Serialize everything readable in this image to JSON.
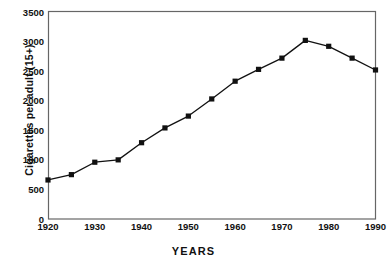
{
  "chart_data": {
    "type": "line",
    "title": "",
    "xlabel": "YEARS",
    "ylabel": "Cigarettes per adult (15+)",
    "xlim": [
      1920,
      1990
    ],
    "ylim": [
      0,
      3500
    ],
    "xticks": [
      1920,
      1930,
      1940,
      1950,
      1960,
      1970,
      1980,
      1990
    ],
    "xtick_labels": [
      "1920",
      "1930",
      "1940",
      "1950",
      "1960",
      "1970",
      "1980",
      "1990"
    ],
    "yticks": [
      0,
      500,
      1000,
      1500,
      2000,
      2500,
      3000,
      3500
    ],
    "ytick_labels": [
      "0",
      "500",
      "1000",
      "1500",
      "2000",
      "2500",
      "3000",
      "3500"
    ],
    "grid": false,
    "legend": null,
    "marker": "square",
    "marker_color": "#111111",
    "line_color": "#111111",
    "x": [
      1920,
      1925,
      1930,
      1935,
      1940,
      1945,
      1950,
      1955,
      1960,
      1965,
      1970,
      1975,
      1980,
      1985,
      1990
    ],
    "y": [
      660,
      750,
      960,
      1000,
      1290,
      1540,
      1740,
      2030,
      2330,
      2530,
      2720,
      3020,
      2920,
      2720,
      2520
    ],
    "series": [
      {
        "name": "Cigarettes per adult (15+)",
        "points": [
          {
            "x": 1920,
            "y": 660
          },
          {
            "x": 1925,
            "y": 750
          },
          {
            "x": 1930,
            "y": 960
          },
          {
            "x": 1935,
            "y": 1000
          },
          {
            "x": 1940,
            "y": 1290
          },
          {
            "x": 1945,
            "y": 1540
          },
          {
            "x": 1950,
            "y": 1740
          },
          {
            "x": 1955,
            "y": 2030
          },
          {
            "x": 1960,
            "y": 2330
          },
          {
            "x": 1965,
            "y": 2530
          },
          {
            "x": 1970,
            "y": 2720
          },
          {
            "x": 1975,
            "y": 3020
          },
          {
            "x": 1980,
            "y": 2920
          },
          {
            "x": 1985,
            "y": 2720
          },
          {
            "x": 1990,
            "y": 2520
          }
        ]
      }
    ]
  },
  "colors": {
    "background": "#ffffff",
    "axis": "#555555",
    "ink": "#111111"
  }
}
